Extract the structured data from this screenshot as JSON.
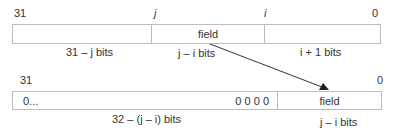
{
  "top_register": {
    "bit_labels": {
      "msb": "31",
      "j": "j",
      "i": "i",
      "lsb": "0"
    },
    "fields": [
      {
        "text": "",
        "width_label": "31 – j bits"
      },
      {
        "text": "field",
        "width_label": "j – i bits"
      },
      {
        "text": "",
        "width_label": "i + 1 bits"
      }
    ]
  },
  "bottom_register": {
    "bit_labels": {
      "msb": "31",
      "lsb": "0"
    },
    "fields": [
      {
        "text_left": "0...",
        "text_right": "0 0 0 0",
        "width_label": "32 – (j – i) bits"
      },
      {
        "text": "field",
        "width_label": "j – i bits"
      }
    ]
  },
  "arrow": {
    "from": "top field",
    "to": "bottom field"
  }
}
